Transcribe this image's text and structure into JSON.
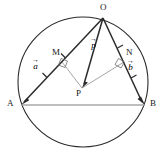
{
  "figure": {
    "colors": {
      "stroke_dark": "#2b2b2b",
      "stroke_light": "#9a9a9a",
      "chord": "#a8a8a8",
      "background": "#ffffff"
    },
    "circle": {
      "cx": 83,
      "cy": 82,
      "r": 65
    },
    "points": {
      "O": {
        "label": "O",
        "x": 103,
        "y": 18,
        "label_x": 100,
        "label_y": 5
      },
      "A": {
        "label": "A",
        "x": 21,
        "y": 105,
        "label_x": 8,
        "label_y": 100
      },
      "B": {
        "label": "B",
        "x": 145,
        "y": 105,
        "label_x": 149,
        "label_y": 100
      },
      "P": {
        "label": "P",
        "x": 82,
        "y": 88,
        "label_x": 77,
        "label_y": 90
      },
      "M": {
        "label": "M",
        "x": 62,
        "y": 62,
        "label_x": 53,
        "label_y": 50
      },
      "N": {
        "label": "N",
        "x": 124,
        "y": 62,
        "label_x": 126,
        "label_y": 50
      }
    },
    "vectors": [
      {
        "name": "a",
        "label": "a",
        "arrow": "→",
        "from": "O",
        "to": "A",
        "label_x": 33,
        "label_y": 63
      },
      {
        "name": "p",
        "label": "p",
        "arrow": "→",
        "from": "O",
        "to": "P",
        "label_x": 91,
        "label_y": 42
      },
      {
        "name": "b",
        "label": "b",
        "arrow": "→",
        "from": "O",
        "to": "B",
        "label_x": 128,
        "label_y": 64
      }
    ],
    "segments": [
      {
        "name": "chord-AB",
        "from": "A",
        "to": "B",
        "style": "light"
      },
      {
        "name": "segment-PM",
        "from": "P",
        "to": "M",
        "style": "light"
      },
      {
        "name": "segment-PN",
        "from": "P",
        "to": "N",
        "style": "light"
      }
    ],
    "right_angles": [
      {
        "name": "right-angle-M",
        "at": "M"
      },
      {
        "name": "right-angle-N",
        "at": "N"
      }
    ]
  }
}
